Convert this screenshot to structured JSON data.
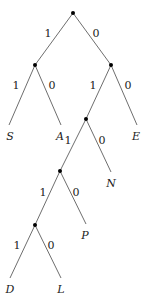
{
  "diagram": {
    "type": "binary-tree",
    "nodes": [
      {
        "id": "root",
        "x": 73,
        "y": 13
      },
      {
        "id": "n1",
        "x": 35,
        "y": 65
      },
      {
        "id": "n2",
        "x": 111,
        "y": 65
      },
      {
        "id": "n3",
        "x": 86,
        "y": 119
      },
      {
        "id": "n4",
        "x": 60,
        "y": 171
      },
      {
        "id": "n5",
        "x": 35,
        "y": 225
      }
    ],
    "leaves": [
      {
        "id": "S",
        "label": "S",
        "x": 9,
        "y": 125,
        "lx": 10,
        "ly": 140
      },
      {
        "id": "A",
        "label": "A",
        "x": 61,
        "y": 125,
        "lx": 60,
        "ly": 140
      },
      {
        "id": "E",
        "label": "E",
        "x": 137,
        "y": 125,
        "lx": 136,
        "ly": 140
      },
      {
        "id": "N",
        "label": "N",
        "x": 111,
        "y": 172,
        "lx": 111,
        "ly": 187
      },
      {
        "id": "P",
        "label": "P",
        "x": 86,
        "y": 224,
        "lx": 85,
        "ly": 239
      },
      {
        "id": "D",
        "label": "D",
        "x": 10,
        "y": 278,
        "lx": 10,
        "ly": 293
      },
      {
        "id": "L",
        "label": "L",
        "x": 61,
        "y": 278,
        "lx": 61,
        "ly": 293
      }
    ],
    "edges": [
      {
        "from": "root",
        "to": "n1",
        "label": "1",
        "lx": 48,
        "ly": 37
      },
      {
        "from": "root",
        "to": "n2",
        "label": "0",
        "lx": 96,
        "ly": 37
      },
      {
        "from": "n1",
        "to": "S",
        "label": "1",
        "lx": 16,
        "ly": 89
      },
      {
        "from": "n1",
        "to": "A",
        "label": "0",
        "lx": 52,
        "ly": 89
      },
      {
        "from": "n2",
        "to": "n3",
        "label": "1",
        "lx": 93,
        "ly": 89
      },
      {
        "from": "n2",
        "to": "E",
        "label": "0",
        "lx": 128,
        "ly": 89
      },
      {
        "from": "n3",
        "to": "n4",
        "label": "1",
        "lx": 68,
        "ly": 144
      },
      {
        "from": "n3",
        "to": "N",
        "label": "0",
        "lx": 102,
        "ly": 144
      },
      {
        "from": "n4",
        "to": "n5",
        "label": "1",
        "lx": 43,
        "ly": 196
      },
      {
        "from": "n4",
        "to": "P",
        "label": "0",
        "lx": 76,
        "ly": 196
      },
      {
        "from": "n5",
        "to": "D",
        "label": "1",
        "lx": 17,
        "ly": 249
      },
      {
        "from": "n5",
        "to": "L",
        "label": "0",
        "lx": 51,
        "ly": 249
      }
    ]
  }
}
